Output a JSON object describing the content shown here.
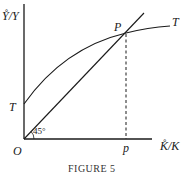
{
  "figure": {
    "caption": "FIGURE 5",
    "y_axis_label": "Y̊/Y",
    "x_axis_label": "K̊/K",
    "origin_label": "O",
    "intercept_label": "T",
    "curve_end_label": "T",
    "intersection_label": "P",
    "foot_label": "p",
    "angle_label": "45°"
  },
  "colors": {
    "ink": "#1a1a1a",
    "background": "#ffffff"
  }
}
